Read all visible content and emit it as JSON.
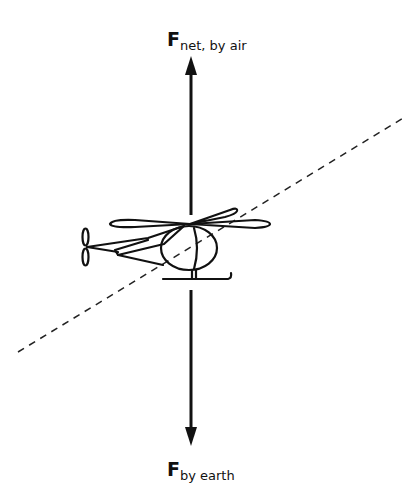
{
  "diagram": {
    "forces": [
      {
        "id": "up",
        "symbol": "F",
        "subscript": "net, by air",
        "direction": "up"
      },
      {
        "id": "down",
        "symbol": "F",
        "subscript": "by earth",
        "direction": "down"
      }
    ],
    "object": "helicopter",
    "reference_line": "dashed diagonal line",
    "colors": {
      "ink": "#111111",
      "background": "#ffffff"
    }
  }
}
